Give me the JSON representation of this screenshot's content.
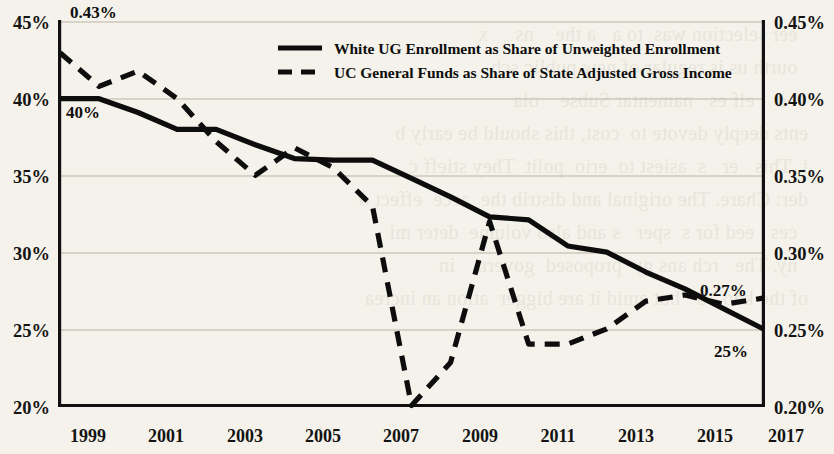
{
  "chart_data": {
    "type": "line",
    "title": "",
    "subtitle": "",
    "xlabel": "",
    "ylabel": "",
    "grid": true,
    "legend_position": "top-right-inside",
    "x": [
      1999,
      2000,
      2001,
      2002,
      2003,
      2004,
      2005,
      2006,
      2007,
      2008,
      2009,
      2010,
      2011,
      2012,
      2013,
      2014,
      2015,
      2016,
      2017
    ],
    "x_tick_labels": [
      "1999",
      "2001",
      "2003",
      "2005",
      "2007",
      "2009",
      "2011",
      "2013",
      "2015",
      "2017"
    ],
    "x_ticks": [
      1999,
      2001,
      2003,
      2005,
      2007,
      2009,
      2011,
      2013,
      2015,
      2017
    ],
    "xlim": [
      1999,
      2017
    ],
    "axes": [
      {
        "id": "left",
        "side": "left",
        "ylim": [
          20,
          45
        ],
        "ticks": [
          20,
          25,
          30,
          35,
          40,
          45
        ],
        "tick_labels": [
          "20%",
          "25%",
          "30%",
          "35%",
          "40%",
          "45%"
        ],
        "unit": "%"
      },
      {
        "id": "right",
        "side": "right",
        "ylim": [
          0.2,
          0.45
        ],
        "ticks": [
          0.2,
          0.25,
          0.3,
          0.35,
          0.4,
          0.45
        ],
        "tick_labels": [
          "0.20%",
          "0.25%",
          "0.30%",
          "0.35%",
          "0.40%",
          "0.45%"
        ],
        "unit": "%"
      }
    ],
    "series": [
      {
        "name": "White UG Enrollment as Share of Unweighted Enrollment",
        "axis": "left",
        "style": "solid",
        "color": "#0d0d0d",
        "values": [
          40.0,
          40.0,
          39.1,
          38.0,
          38.0,
          37.0,
          36.1,
          36.0,
          36.0,
          34.8,
          33.6,
          32.3,
          32.1,
          30.4,
          30.0,
          28.7,
          27.6,
          26.3,
          25.0
        ]
      },
      {
        "name": "UC General Funds as Share of State Adjusted Gross Income",
        "axis": "right",
        "style": "dashed",
        "color": "#0d0d0d",
        "values": [
          0.43,
          0.408,
          0.418,
          0.4,
          0.372,
          0.35,
          0.368,
          0.355,
          0.33,
          0.2,
          0.228,
          0.32,
          0.24,
          0.24,
          0.25,
          0.268,
          0.272,
          0.266,
          0.27
        ]
      }
    ],
    "annotations": [
      {
        "label": "0.43%",
        "series": "UC General Funds as Share of State Adjusted Gross Income",
        "x": 1999,
        "value": 0.43,
        "position": "above"
      },
      {
        "label": "40%",
        "series": "White UG Enrollment as Share of Unweighted Enrollment",
        "x": 1999,
        "value": 40.0,
        "position": "below"
      },
      {
        "label": "0.27%",
        "series": "UC General Funds as Share of State Adjusted Gross Income",
        "x": 2017,
        "value": 0.27,
        "position": "above"
      },
      {
        "label": "25%",
        "series": "White UG Enrollment as Share of Unweighted Enrollment",
        "x": 2017,
        "value": 25.0,
        "position": "below"
      }
    ]
  },
  "legend": {
    "entries": [
      {
        "label": "White UG Enrollment as Share of Unweighted Enrollment",
        "style": "solid"
      },
      {
        "label": "UC General Funds as Share of State Adjusted Gross Income",
        "style": "dashed"
      }
    ]
  },
  "bleed_text": "  eer selection was  to a   a the    ns     x\n  ourth us is regular of new public sch\n    d    elf es   namentar Subse    ola\nents deeply devote to  cost, this should be early b\ni. This   er   s  asiest to  erio  polit  They stieff c\nder: Chare. The original and distrib the  acce  effect o\n  ces   eed for s  sper   s and also volume  deter mi\n  ny. The   rch ans gy  proposed  govern    in\nof the kno   o   but amid it are bigger  ation an increa"
}
